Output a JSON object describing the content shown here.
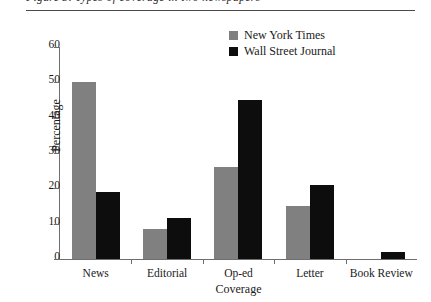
{
  "header": {
    "caption_clipped": "Figure 3. Types of coverage in two newspapers",
    "rule": "horizontal-rule"
  },
  "chart_data": {
    "type": "bar",
    "title": "",
    "xlabel": "Coverage",
    "ylabel": "Percentage",
    "categories": [
      "News",
      "Editorial",
      "Op-ed",
      "Letter",
      "Book Review"
    ],
    "series": [
      {
        "name": "New York Times",
        "color": "#808080",
        "values": [
          50,
          8.5,
          26,
          15,
          0
        ]
      },
      {
        "name": "Wall Street Journal",
        "color": "#0d0d0d",
        "values": [
          19,
          11.5,
          45,
          21,
          2
        ]
      }
    ],
    "ylim": [
      0,
      60
    ],
    "yticks": [
      0,
      10,
      20,
      30,
      40,
      50,
      60
    ],
    "ytick_labels": [
      "0",
      "10",
      "20",
      "30",
      "40",
      "50",
      "60"
    ],
    "grid": false,
    "legend_position": "top-right"
  }
}
